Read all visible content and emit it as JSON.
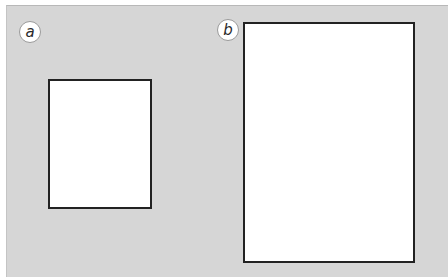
{
  "figure": {
    "background_color": "#d6d6d6",
    "panels": [
      {
        "label": "a",
        "shape": "rectangle",
        "fill": "#ffffff",
        "border_color": "#222222",
        "x": 48,
        "y": 79,
        "width": 104,
        "height": 130
      },
      {
        "label": "b",
        "shape": "rectangle",
        "fill": "#ffffff",
        "border_color": "#222222",
        "x": 243,
        "y": 22,
        "width": 172,
        "height": 241
      }
    ]
  }
}
